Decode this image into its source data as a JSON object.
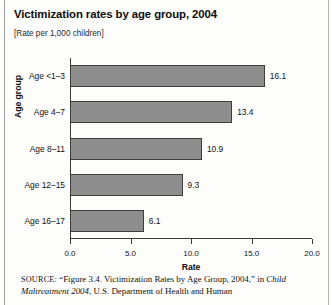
{
  "figure": {
    "title": "Victimization rates by age group, 2004",
    "subtitle": "[Rate per 1,000 children]"
  },
  "source_note": {
    "label": "SOURCE:",
    "text_before_italic": " “Figure 3.4. Victimization Rates by Age Group, 2004,” in ",
    "italic_title": "Child Maltreatment 2004",
    "text_after_italic": ", U.S. Department of Health and Human"
  },
  "chart_data": {
    "type": "bar",
    "orientation": "horizontal",
    "title": "Victimization rates by age group, 2004",
    "subtitle": "[Rate per 1,000 children]",
    "xlabel": "Rate",
    "ylabel": "Age group",
    "categories": [
      "Age <1–3",
      "Age 4–7",
      "Age 8–11",
      "Age 12–15",
      "Age 16–17"
    ],
    "values": [
      16.1,
      13.4,
      10.9,
      9.3,
      6.1
    ],
    "value_labels": [
      "16.1",
      "13.4",
      "10.9",
      "9.3",
      "6.1"
    ],
    "xlim": [
      0.0,
      20.0
    ],
    "xticks": [
      0.0,
      5.0,
      10.0,
      15.0,
      20.0
    ],
    "xtick_labels": [
      "0.0",
      "5.0",
      "10.0",
      "15.0",
      "20.0"
    ],
    "grid": false,
    "legend": "none",
    "bar_color": "#8e8e8e",
    "bar_edge_color": "#3d3d3d"
  }
}
